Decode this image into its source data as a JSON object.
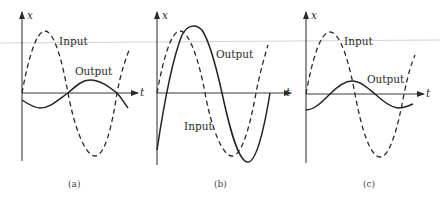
{
  "figure": {
    "axis_labels": {
      "vertical": "x",
      "horizontal": "t"
    },
    "panels": [
      {
        "id": "a",
        "caption": "(a)",
        "input_label": "Input",
        "output_label": "Output",
        "note": "Output small amplitude, phase-lagged ~180° relative to input"
      },
      {
        "id": "b",
        "caption": "(b)",
        "input_label": "Input",
        "output_label": "Output",
        "note": "Output larger amplitude than input, lagging by a small phase"
      },
      {
        "id": "c",
        "caption": "(c)",
        "input_label": "Input",
        "output_label": "Output",
        "note": "Output small amplitude, lagging ~90° relative to input"
      }
    ]
  }
}
